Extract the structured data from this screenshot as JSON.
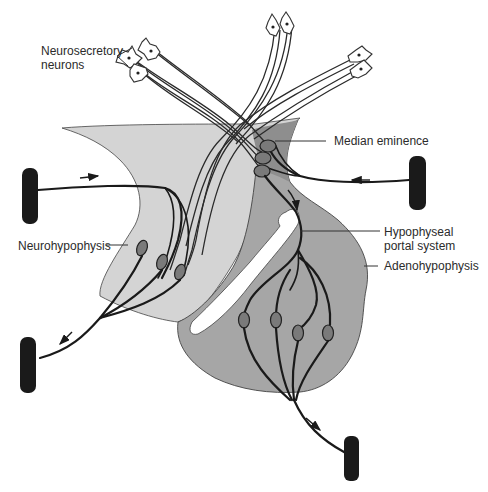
{
  "diagram": {
    "labels": {
      "neurosecretory_line1": "Neurosecretory",
      "neurosecretory_line2": "neurons",
      "median_eminence": "Median eminence",
      "neurohypophysis": "Neurohypophysis",
      "portal_line1": "Hypophyseal",
      "portal_line2": "portal system",
      "adenohypophysis": "Adenohypophysis"
    },
    "colors": {
      "neurohypophysis_fill": "#d2d2d2",
      "adenohypophysis_fill": "#a4a4a4",
      "median_eminence_fill": "#8c8c8c",
      "vessel": "#1a1a1a",
      "cleft": "#ffffff"
    },
    "flow_arrows": [
      {
        "location": "upper-left artery",
        "direction": "right"
      },
      {
        "location": "upper-right artery",
        "direction": "left"
      },
      {
        "location": "portal stalk",
        "direction": "down"
      },
      {
        "location": "lower-left vein",
        "direction": "down-left"
      },
      {
        "location": "lower-right vein",
        "direction": "down-right"
      }
    ],
    "neuron_count": 7,
    "portal_capillary_beds": {
      "median_eminence": 3,
      "adenohypophysis": 4,
      "neurohypophysis": 3
    }
  }
}
